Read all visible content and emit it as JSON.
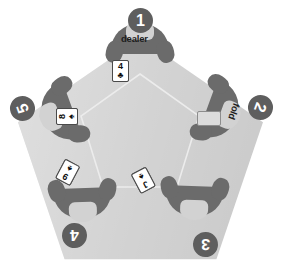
{
  "scene": {
    "title": "five-player card table",
    "table_color": "#d2d2d2",
    "seat_color": "#6b6b6b",
    "badge_color": "#5e5e5e",
    "background": "#ffffff"
  },
  "seats": [
    {
      "number": "1",
      "label": "dealer",
      "status": "dealer",
      "cards": [
        {
          "rank": "3",
          "suit": "♣",
          "state": "dim"
        },
        {
          "rank": "3",
          "suit": "♠",
          "state": "face"
        },
        {
          "rank": "4",
          "suit": "♣",
          "state": "face"
        }
      ]
    },
    {
      "number": "2",
      "label": "fold",
      "status": "folded",
      "cards": [
        {
          "rank": "",
          "suit": "",
          "state": "blank"
        }
      ]
    },
    {
      "number": "3",
      "label": "",
      "status": "active",
      "cards": [
        {
          "rank": "J",
          "suit": "♠",
          "state": "face"
        },
        {
          "rank": "10",
          "suit": "♠",
          "state": "face"
        },
        {
          "rank": "",
          "suit": "♣",
          "state": "ghost"
        }
      ]
    },
    {
      "number": "4",
      "label": "",
      "status": "active",
      "cards": [
        {
          "rank": "9",
          "suit": "♠",
          "state": "face"
        },
        {
          "rank": "Q",
          "suit": "♦",
          "state": "face"
        },
        {
          "rank": "9",
          "suit": "♣",
          "state": "ghost"
        }
      ]
    },
    {
      "number": "5",
      "label": "",
      "status": "active",
      "cards": [
        {
          "rank": "8",
          "suit": "♠",
          "state": "face"
        },
        {
          "rank": "7",
          "suit": "♠",
          "state": "face"
        },
        {
          "rank": "",
          "suit": "♣",
          "state": "ghost"
        }
      ]
    }
  ]
}
